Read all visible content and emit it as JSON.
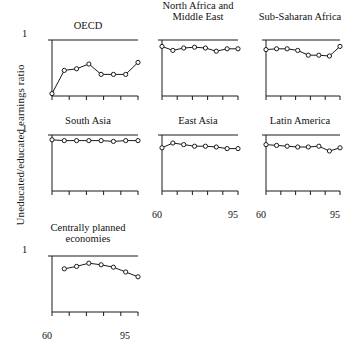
{
  "figure": {
    "ylabel": "Uneducated/educated earnings ratio",
    "ytick_top": "1",
    "xtick_left": "60",
    "xtick_right": "95"
  },
  "chart_data": {
    "type": "line",
    "title": "",
    "xlabel": "",
    "ylabel": "Uneducated/educated earnings ratio",
    "xlim": [
      60,
      95
    ],
    "ylim": [
      0.3,
      1.0
    ],
    "grid": false,
    "legend": "none",
    "marker": "open-circle",
    "xticks": [
      60,
      67,
      74,
      81,
      88,
      95
    ],
    "xticklabels": [
      "60",
      "",
      "",
      "",
      "",
      "95"
    ],
    "yticks": [
      1.0
    ],
    "yticklabels": [
      "1"
    ],
    "panels": [
      {
        "title": "OECD",
        "x": [
          60,
          65,
          70,
          75,
          80,
          85,
          90,
          95
        ],
        "values": [
          0.33,
          0.62,
          0.64,
          0.7,
          0.57,
          0.57,
          0.57,
          0.72
        ]
      },
      {
        "title": "North Africa and Middle East",
        "title_lines": [
          "North Africa and",
          "Middle East"
        ],
        "x": [
          60,
          65,
          70,
          75,
          80,
          85,
          90,
          95
        ],
        "values": [
          0.92,
          0.87,
          0.9,
          0.91,
          0.9,
          0.86,
          0.89,
          0.89
        ]
      },
      {
        "title": "Sub-Saharan Africa",
        "x": [
          60,
          65,
          70,
          75,
          80,
          85,
          90,
          95
        ],
        "values": [
          0.88,
          0.89,
          0.89,
          0.87,
          0.81,
          0.81,
          0.8,
          0.92
        ]
      },
      {
        "title": "South Asia",
        "x": [
          60,
          65,
          70,
          75,
          80,
          85,
          90,
          95
        ],
        "values": [
          0.94,
          0.93,
          0.93,
          0.93,
          0.93,
          0.92,
          0.93,
          0.93
        ]
      },
      {
        "title": "East Asia",
        "x": [
          60,
          65,
          70,
          75,
          80,
          85,
          90,
          95
        ],
        "values": [
          0.84,
          0.9,
          0.88,
          0.86,
          0.86,
          0.85,
          0.83,
          0.83,
          0.89
        ]
      },
      {
        "title": "Latin America",
        "x": [
          60,
          65,
          70,
          75,
          80,
          85,
          90,
          95
        ],
        "values": [
          0.88,
          0.87,
          0.86,
          0.85,
          0.85,
          0.86,
          0.8,
          0.84
        ]
      },
      {
        "title": "Centrally planned economies",
        "title_lines": [
          "Centrally planned",
          "economies"
        ],
        "x": [
          65,
          70,
          75,
          80,
          85,
          90,
          95
        ],
        "values": [
          0.84,
          0.87,
          0.91,
          0.89,
          0.86,
          0.8,
          0.74
        ]
      }
    ]
  }
}
